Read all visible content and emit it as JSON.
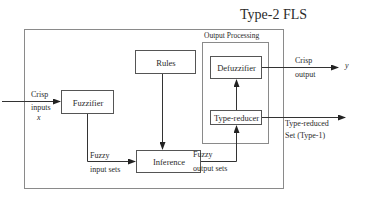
{
  "title": "Type-2 FLS",
  "output_processing_label": "Output Processing",
  "blocks": {
    "rules": "Rules",
    "fuzzifier": "Fuzzifier",
    "inference": "Inference",
    "defuzzifier": "Defuzzifier",
    "type_reducer": "Type-reducer"
  },
  "edges": {
    "crisp_inputs_line1": "Crisp",
    "crisp_inputs_line2": "inputs",
    "crisp_inputs_var": "x",
    "fuzzy_input_line1": "Fuzzy",
    "fuzzy_input_line2": "input sets",
    "fuzzy_output_line1": "Fuzzy",
    "fuzzy_output_line2": "output sets",
    "crisp_output_line1": "Crisp",
    "crisp_output_line2": "output",
    "crisp_output_var": "y",
    "type_reduced_line1": "Type-reduced",
    "type_reduced_line2": "Set (Type-1)"
  },
  "colors": {
    "line": "#333333",
    "outer_border": "#8a8a8a",
    "background": "#ffffff"
  }
}
